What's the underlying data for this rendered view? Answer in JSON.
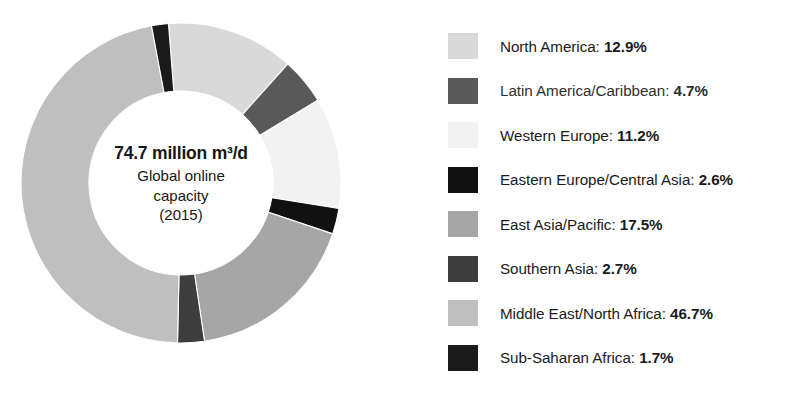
{
  "chart_data": {
    "type": "pie",
    "variant": "donut",
    "title": "",
    "center_label": {
      "headline": "74.7 million m³/d",
      "sublines": [
        "Global online",
        "capacity",
        "(2015)"
      ]
    },
    "units": "%",
    "total_capacity": "74.7 million m³/d",
    "year": "2015",
    "legend_position": "right",
    "start_angle_deg": -4.5,
    "categories": [
      "North America",
      "Latin America/Caribbean",
      "Western Europe",
      "Eastern Europe/Central Asia",
      "East Asia/Pacific",
      "Southern Asia",
      "Middle East/North Africa",
      "Sub-Saharan Africa"
    ],
    "values": [
      12.9,
      4.7,
      11.2,
      2.6,
      17.5,
      2.7,
      46.7,
      1.7
    ],
    "colors": [
      "#d9d9d9",
      "#595959",
      "#f2f2f2",
      "#111111",
      "#a6a6a6",
      "#3d3d3d",
      "#bfbfbf",
      "#1a1a1a"
    ],
    "slices": [
      {
        "label": "North America",
        "value": 12.9,
        "display": "12.9%",
        "color": "#d9d9d9"
      },
      {
        "label": "Latin America/Caribbean",
        "value": 4.7,
        "display": "4.7%",
        "color": "#595959"
      },
      {
        "label": "Western Europe",
        "value": 11.2,
        "display": "11.2%",
        "color": "#f2f2f2"
      },
      {
        "label": "Eastern Europe/Central Asia",
        "value": 2.6,
        "display": "2.6%",
        "color": "#111111"
      },
      {
        "label": "East Asia/Pacific",
        "value": 17.5,
        "display": "17.5%",
        "color": "#a6a6a6"
      },
      {
        "label": "Southern Asia",
        "value": 2.7,
        "display": "2.7%",
        "color": "#3d3d3d"
      },
      {
        "label": "Middle East/North Africa",
        "value": 46.7,
        "display": "46.7%",
        "color": "#bfbfbf"
      },
      {
        "label": "Sub-Saharan Africa",
        "value": 1.7,
        "display": "1.7%",
        "color": "#1a1a1a"
      }
    ]
  },
  "legend": {
    "items": [
      {
        "label": "North America",
        "separator": ": ",
        "value": "12.9%",
        "color": "#d9d9d9",
        "faded": false
      },
      {
        "label": "Latin America/Caribbean",
        "separator": ": ",
        "value": "4.7%",
        "color": "#595959",
        "faded": true
      },
      {
        "label": "Western Europe",
        "separator": ": ",
        "value": "11.2%",
        "color": "#f2f2f2",
        "faded": false
      },
      {
        "label": "Eastern Europe/Central Asia",
        "separator": ": ",
        "value": "2.6%",
        "color": "#111111",
        "faded": false
      },
      {
        "label": "East Asia/Pacific",
        "separator": ": ",
        "value": "17.5%",
        "color": "#a6a6a6",
        "faded": false
      },
      {
        "label": "Southern Asia",
        "separator": ": ",
        "value": "2.7%",
        "color": "#3d3d3d",
        "faded": false
      },
      {
        "label": "Middle East/North Africa",
        "separator": ": ",
        "value": "46.7%",
        "color": "#bfbfbf",
        "faded": false
      },
      {
        "label": "Sub-Saharan Africa",
        "separator": ": ",
        "value": "1.7%",
        "color": "#1a1a1a",
        "faded": false
      }
    ]
  },
  "geometry": {
    "cx": 163,
    "cy": 163,
    "outer_radius": 160,
    "inner_radius": 92
  }
}
